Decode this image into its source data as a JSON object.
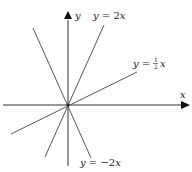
{
  "diagram": {
    "title": "",
    "axes": {
      "x_label": "x",
      "y_label": "y"
    },
    "lines": [
      {
        "equation": "y = 2x",
        "label_prefix": "y = 2",
        "label_var": "x",
        "slope": 2
      },
      {
        "equation": "y = 1/2 x",
        "label_prefix": "y = ",
        "frac_num": "1",
        "frac_den": "2",
        "label_var": "x",
        "slope": 0.5
      },
      {
        "equation": "y = -2x",
        "label_prefix": "y = −2",
        "label_var": "x",
        "slope": -2
      }
    ],
    "colors": {
      "axes": "#333333",
      "lines": "#555555"
    }
  }
}
